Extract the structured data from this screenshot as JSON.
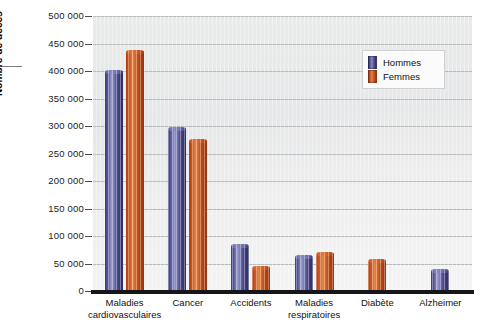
{
  "chart_data": {
    "type": "bar",
    "title": "",
    "subtitle": "",
    "xlabel": "",
    "ylabel": "Nombre de décès",
    "ylim": [
      0,
      500000
    ],
    "ytick_step": 50000,
    "grid": true,
    "grid_orientation": "horizontal",
    "legend_position": "top-right",
    "categories": [
      "Maladies\ncardiovasculaires",
      "Cancer",
      "Accidents",
      "Maladies\nrespiratoires",
      "Diabète",
      "Alzheimer"
    ],
    "ytick_labels": [
      "0",
      "50 000",
      "100 000",
      "150 000",
      "200 000",
      "250 000",
      "300 000",
      "350 000",
      "400 000",
      "450 000",
      "500 000"
    ],
    "ytick_values": [
      0,
      50000,
      100000,
      150000,
      200000,
      250000,
      300000,
      350000,
      400000,
      450000,
      500000
    ],
    "series": [
      {
        "name": "Hommes",
        "color": "#4a4a8c",
        "values": [
          399000,
          295000,
          82000,
          62000,
          null,
          37000
        ]
      },
      {
        "name": "Femmes",
        "color": "#c2491a",
        "values": [
          434000,
          273000,
          42000,
          67000,
          55000,
          null
        ]
      }
    ]
  },
  "legend": {
    "items": [
      {
        "label": "Hommes",
        "color": "#4a4a8c"
      },
      {
        "label": "Femmes",
        "color": "#c2491a"
      }
    ]
  },
  "axis": {
    "y_title": "Nombre de décès"
  }
}
